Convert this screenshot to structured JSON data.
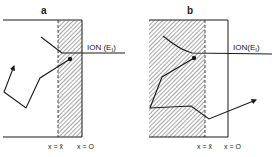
{
  "panels": [
    {
      "label": "a",
      "ion_label": "ION (E",
      "ion_sub": "I",
      "ion_close": ")",
      "x_hat_label": "x = x̂",
      "x0_label": "x = O"
    },
    {
      "label": "b",
      "ion_label": "ION(E",
      "ion_sub": "I",
      "ion_close": ")",
      "x_check_label": "x = x̌",
      "x0_label": "x = O"
    }
  ],
  "colors": {
    "line": "#1a1a1a",
    "hatch": "#666666",
    "background": "#ffffff"
  }
}
